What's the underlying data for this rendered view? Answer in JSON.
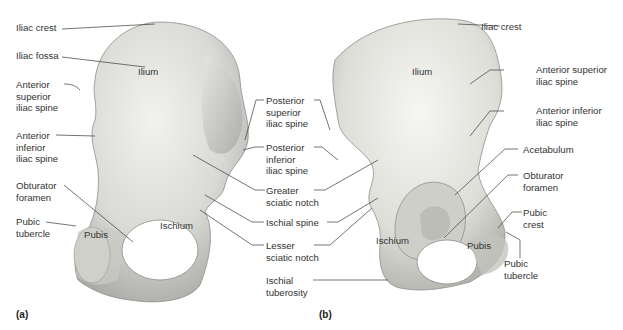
{
  "figure": {
    "panel_a": {
      "panel_label": "(a)",
      "regions": {
        "ilium": "Ilium",
        "pubis": "Pubis",
        "ischium": "Ischium"
      },
      "left_labels": [
        "Iliac crest",
        "Iliac fossa",
        "Anterior\nsuperior\niliac spine",
        "Anterior\ninferior\niliac spine",
        "Obturator\nforamen",
        "Pubic\ntubercle"
      ]
    },
    "center_labels": [
      "Posterior\nsuperior\niliac spine",
      "Posterior\ninferior\niliac spine",
      "Greater\nsciatic notch",
      "Ischial spine",
      "Lesser\nsciatic notch",
      "Ischial\ntuberosity"
    ],
    "panel_b": {
      "panel_label": "(b)",
      "regions": {
        "ilium": "Ilium",
        "ischium": "Ischium",
        "pubis": "Pubis"
      },
      "right_labels": [
        "Iliac crest",
        "Anterior superior\niliac spine",
        "Anterior inferior\niliac spine",
        "Acetabulum",
        "Obturator\nforamen",
        "Pubic\ncrest",
        "Pubic\ntubercle"
      ]
    },
    "colors": {
      "bone_light": "#eeeeea",
      "bone_mid": "#cfcfcb",
      "bone_dark": "#9c9c98",
      "pubis_tint": "#c9c9c4",
      "leader": "#3a3a3a"
    }
  }
}
